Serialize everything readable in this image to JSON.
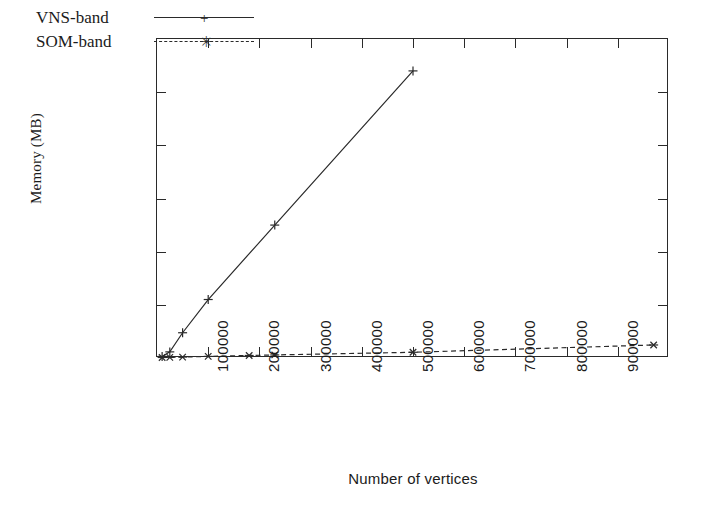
{
  "chart_data": {
    "type": "line",
    "title": "",
    "xlabel": "Number of vertices",
    "ylabel": "Memory (MB)",
    "xlim": [
      0,
      1000000
    ],
    "ylim": [
      0,
      12000
    ],
    "xticks": [
      100000,
      200000,
      300000,
      400000,
      500000,
      600000,
      700000,
      800000,
      900000
    ],
    "xticklabels": [
      "100000",
      "200000",
      "300000",
      "400000",
      "500000",
      "600000",
      "700000",
      "800000",
      "900000"
    ],
    "yticks": [
      0,
      2000,
      4000,
      6000,
      8000,
      10000,
      12000
    ],
    "yticklabels": [
      "0",
      "2000",
      "4000",
      "6000",
      "8000",
      "10000",
      "12000"
    ],
    "grid": false,
    "legend_position": "top-left-inside",
    "series": [
      {
        "name": "VNS-band",
        "linestyle": "solid",
        "marker": "plus",
        "color": "#2a2a2a",
        "points": [
          {
            "x": 10000,
            "y": 60
          },
          {
            "x": 25000,
            "y": 230
          },
          {
            "x": 50000,
            "y": 950
          },
          {
            "x": 100000,
            "y": 2200
          },
          {
            "x": 230000,
            "y": 5000
          },
          {
            "x": 500000,
            "y": 10800
          }
        ]
      },
      {
        "name": "SOM-band",
        "linestyle": "dashed",
        "marker": "asterisk",
        "color": "#2a2a2a",
        "points": [
          {
            "x": 10000,
            "y": 20
          },
          {
            "x": 25000,
            "y": 25
          },
          {
            "x": 50000,
            "y": 35
          },
          {
            "x": 100000,
            "y": 60
          },
          {
            "x": 180000,
            "y": 95
          },
          {
            "x": 230000,
            "y": 115
          },
          {
            "x": 500000,
            "y": 215
          },
          {
            "x": 970000,
            "y": 490
          }
        ]
      }
    ]
  },
  "legend": {
    "entries": [
      {
        "label": "VNS-band",
        "marker_glyph": "+"
      },
      {
        "label": "SOM-band",
        "marker_glyph": "✳"
      }
    ]
  }
}
